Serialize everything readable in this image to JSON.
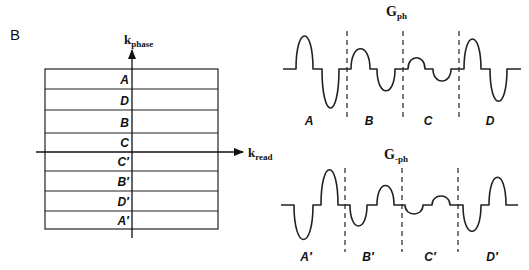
{
  "panel_label": "B",
  "kspace": {
    "axes": {
      "vertical": {
        "main": "k",
        "sub": "phase"
      },
      "horizontal": {
        "main": "k",
        "sub": "read"
      }
    },
    "rows": [
      {
        "label": "A"
      },
      {
        "label": "D"
      },
      {
        "label": "B"
      },
      {
        "label": "C"
      },
      {
        "label": "C′"
      },
      {
        "label": "B′"
      },
      {
        "label": "D′"
      },
      {
        "label": "A′"
      }
    ]
  },
  "waveforms": {
    "top": {
      "title_main": "G",
      "title_sub": "ph",
      "segments": [
        {
          "label": "A"
        },
        {
          "label": "B"
        },
        {
          "label": "C"
        },
        {
          "label": "D"
        }
      ]
    },
    "bottom": {
      "title_main": "G",
      "title_sub": "-ph",
      "segments": [
        {
          "label": "A′"
        },
        {
          "label": "B′"
        },
        {
          "label": "C′"
        },
        {
          "label": "D′"
        }
      ]
    }
  }
}
